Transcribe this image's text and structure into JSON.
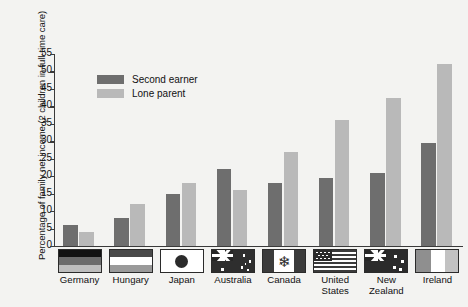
{
  "chart_data": {
    "type": "bar",
    "title": "",
    "xlabel": "",
    "ylabel": "Percentage of family net income (2 children in full-time care)",
    "ylim": [
      0,
      55
    ],
    "yticks": [
      0,
      5,
      10,
      15,
      20,
      25,
      30,
      35,
      40,
      45,
      50,
      55
    ],
    "grid": false,
    "legend_position": "top-left-inside",
    "categories": [
      "Germany",
      "Hungary",
      "Japan",
      "Australia",
      "Canada",
      "United States",
      "New Zealand",
      "Ireland"
    ],
    "category_labels": [
      "Germany",
      "Hungary",
      "Japan",
      "Australia",
      "Canada",
      "United\nStates",
      "New\nZealand",
      "Ireland"
    ],
    "series": [
      {
        "name": "Second earner",
        "color": "#6e6e6e",
        "values": [
          6,
          8,
          15,
          22,
          18,
          19.5,
          21,
          29.5
        ]
      },
      {
        "name": "Lone parent",
        "color": "#b9b9b9",
        "values": [
          4,
          12,
          18,
          16,
          27,
          36,
          42.5,
          52
        ]
      }
    ]
  },
  "axis": {
    "y_title": "Percentage of family net income (2 children in full-time care)",
    "tick_labels": [
      "55",
      "50",
      "45",
      "40",
      "35",
      "30",
      "25",
      "20",
      "15",
      "10",
      "5",
      "0"
    ]
  },
  "legend": {
    "items": [
      {
        "label": "Second earner",
        "color": "#6e6e6e"
      },
      {
        "label": "Lone parent",
        "color": "#b9b9b9"
      }
    ]
  },
  "flags": [
    {
      "country": "Germany",
      "icon": "flag-germany-icon"
    },
    {
      "country": "Hungary",
      "icon": "flag-hungary-icon"
    },
    {
      "country": "Japan",
      "icon": "flag-japan-icon"
    },
    {
      "country": "Australia",
      "icon": "flag-australia-icon"
    },
    {
      "country": "Canada",
      "icon": "flag-canada-icon"
    },
    {
      "country": "United States",
      "icon": "flag-united-states-icon"
    },
    {
      "country": "New Zealand",
      "icon": "flag-new-zealand-icon"
    },
    {
      "country": "Ireland",
      "icon": "flag-ireland-icon"
    }
  ],
  "colors": {
    "second_earner": "#6e6e6e",
    "lone_parent": "#b9b9b9",
    "axis": "#3a3a3a",
    "background": "#f3f3f1"
  }
}
